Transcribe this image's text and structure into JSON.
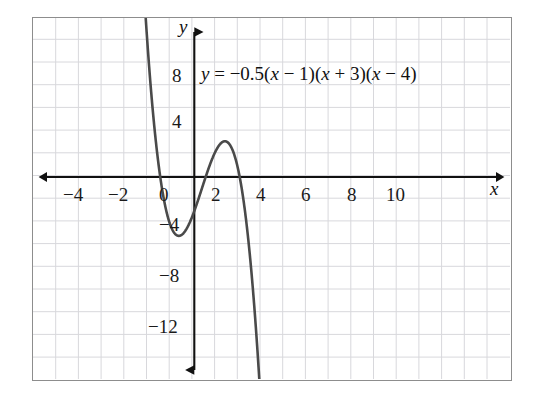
{
  "figure": {
    "border_color": "#8d8d8d",
    "grid_color": "#d8d8dc",
    "axis_color": "#111111",
    "curve_color": "#4a4a4a",
    "background": "#ffffff"
  },
  "annotations": {
    "equation_prefix": "y",
    "equation_eq": " = ",
    "equation_coef": "−0.5(",
    "equation_x1": "x",
    "equation_f1": " − 1)(",
    "equation_x2": "x",
    "equation_f2": " + 3)(",
    "equation_x3": "x",
    "equation_f3": " − 4)",
    "equation_plain": "y = −0.5(x − 1)(x + 3)(x − 4)"
  },
  "axes": {
    "x_axis_label": "x",
    "y_axis_label": "y",
    "x_ticks": [
      {
        "value": -4,
        "label": "−4"
      },
      {
        "value": -2,
        "label": "−2"
      },
      {
        "value": 0,
        "label": "0"
      },
      {
        "value": 2,
        "label": "2"
      },
      {
        "value": 4,
        "label": "4"
      },
      {
        "value": 6,
        "label": "6"
      },
      {
        "value": 8,
        "label": "8"
      },
      {
        "value": 10,
        "label": "10"
      }
    ],
    "y_ticks": [
      {
        "value": 8,
        "label": "8"
      },
      {
        "value": 4,
        "label": "4"
      },
      {
        "value": -4,
        "label": "−4"
      },
      {
        "value": -8,
        "label": "−8"
      },
      {
        "value": -12,
        "label": "−12"
      }
    ]
  },
  "chart_data": {
    "type": "line",
    "title": "",
    "subtitle": "",
    "xlabel": "x",
    "ylabel": "y",
    "equation": "y = -0.5(x - 1)(x + 3)(x - 4)",
    "function": "cubic",
    "leading_coefficient": -0.5,
    "roots": [
      -3,
      1,
      4
    ],
    "y_intercept": -6,
    "local_minimum": {
      "x": -1.52,
      "y": -11.3
    },
    "local_maximum": {
      "x": 2.85,
      "y": 6.1
    },
    "xlim": [
      -5.2,
      11.1
    ],
    "ylim": [
      -18.1,
      14.0
    ],
    "x_tick_step": 2,
    "y_tick_step": 4,
    "grid": true,
    "grid_step_x": 1,
    "grid_step_y": 2,
    "legend": "none",
    "series": [
      {
        "name": "y = -0.5(x - 1)(x + 3)(x - 4)",
        "x": [
          -4.0,
          -3.8,
          -3.6,
          -3.4,
          -3.2,
          -3.0,
          -2.8,
          -2.6,
          -2.4,
          -2.2,
          -2.0,
          -1.8,
          -1.6,
          -1.4,
          -1.2,
          -1.0,
          -0.8,
          -0.6,
          -0.4,
          -0.2,
          0.0,
          0.2,
          0.4,
          0.6,
          0.8,
          1.0,
          1.2,
          1.4,
          1.6,
          1.8,
          2.0,
          2.2,
          2.4,
          2.6,
          2.8,
          3.0,
          3.2,
          3.4,
          3.6,
          3.8,
          4.0,
          4.2,
          4.4,
          4.6,
          4.8,
          5.0,
          5.2,
          5.4
        ],
        "y": [
          20.0,
          13.6,
          7.92,
          2.93,
          -1.39,
          -5.0,
          -8.0,
          -10.4,
          -12.24,
          -13.57,
          -14.4,
          -14.79,
          -14.78,
          -14.41,
          -13.73,
          -12.79,
          -11.62,
          -10.27,
          -8.79,
          -7.23,
          -6.0,
          -4.25,
          -2.6,
          -1.06,
          0.34,
          1.6,
          2.71,
          3.65,
          4.42,
          5.01,
          5.4,
          5.6,
          5.59,
          5.36,
          4.92,
          4.25,
          3.35,
          2.21,
          0.83,
          -0.81,
          -2.72,
          -4.89,
          -7.34,
          -10.07,
          -13.09,
          -16.4,
          -20.01,
          -23.91
        ]
      }
    ]
  }
}
